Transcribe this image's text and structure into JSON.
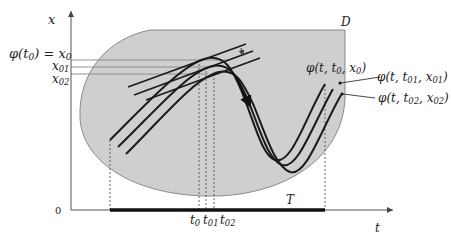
{
  "diagram": {
    "region_label": "D",
    "axis_x_label": "t",
    "axis_y_label": "x",
    "origin_label": "0",
    "interval_label": "T",
    "y_ticks": [
      {
        "main": "φ(t",
        "sub": "0",
        "tail": ") = x",
        "sub2": "0"
      },
      {
        "main": "x",
        "sub": "01"
      },
      {
        "main": "x",
        "sub": "02"
      }
    ],
    "x_ticks": [
      {
        "main": "t",
        "sub": "0"
      },
      {
        "main": "t",
        "sub": "01"
      },
      {
        "main": "t",
        "sub": "02"
      }
    ],
    "curve_labels": [
      {
        "pre": "φ(t, t",
        "s1": "0",
        "mid": ", x",
        "s2": "0",
        "post": ")"
      },
      {
        "pre": "φ(t, t",
        "s1": "01",
        "mid": ", x",
        "s2": "01",
        "post": ")"
      },
      {
        "pre": "φ(t, t",
        "s1": "02",
        "mid": ", x",
        "s2": "02",
        "post": ")"
      }
    ],
    "colors": {
      "region_fill": "#cfcfcf",
      "region_stroke": "#8a8a8a",
      "curve": "#1a1a1a",
      "axis": "#555555",
      "guide": "#888888"
    }
  }
}
